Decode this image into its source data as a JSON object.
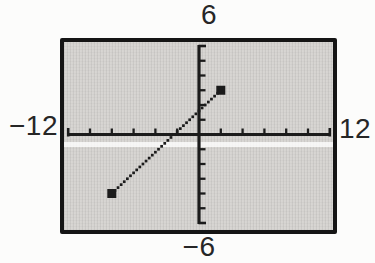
{
  "figure": {
    "kind": "graphing-calculator-viewing-window"
  },
  "chart_data": {
    "type": "line",
    "title": "",
    "xlabel": "",
    "ylabel": "",
    "window": {
      "xmin": -12,
      "xmax": 12,
      "xscl": 2,
      "ymin": -6,
      "ymax": 6,
      "yscl": 1
    },
    "axis_edge_labels": {
      "top": "6",
      "bottom": "−6",
      "left": "−12",
      "right": "12"
    },
    "series": [
      {
        "name": "segment",
        "style": "dotted-pixel-segment",
        "marker": "filled-square",
        "points": [
          [
            -8,
            -4
          ],
          [
            2,
            3
          ]
        ]
      }
    ],
    "grid": false,
    "legend": "none"
  },
  "colors": {
    "ink": "#1b1b1b",
    "frame": "#151515",
    "screen_bg": "#d6d4d1",
    "page_bg": "#fcfcfb",
    "label_text": "#262626"
  }
}
